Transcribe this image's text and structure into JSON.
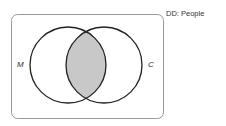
{
  "diagram": {
    "type": "venn",
    "domain_label": "DD: People",
    "sets": [
      {
        "id": "M",
        "label": "M",
        "cx": 68,
        "cy": 65,
        "r": 38
      },
      {
        "id": "C",
        "label": "C",
        "cx": 104,
        "cy": 65,
        "r": 38
      }
    ],
    "shaded_region": "M∩C",
    "colors": {
      "stroke": "#222222",
      "shade": "#c8c8c8",
      "frame": "#999999",
      "background": "#ffffff"
    }
  }
}
